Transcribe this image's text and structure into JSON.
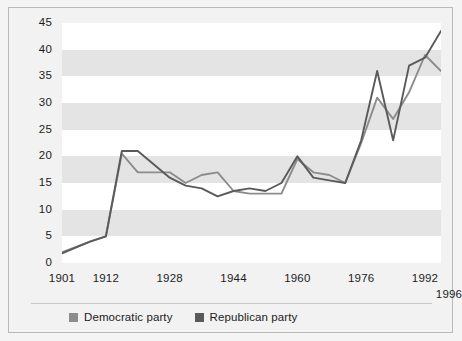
{
  "chart_data": {
    "type": "line",
    "title": "",
    "subtitle": "",
    "xlabel": "",
    "ylabel": "",
    "xlim": [
      1901,
      1996
    ],
    "ylim": [
      0,
      45
    ],
    "grid": "horizontal-bands",
    "legend_position": "bottom-left",
    "y_ticks": [
      0,
      5,
      10,
      15,
      20,
      25,
      30,
      35,
      40,
      45
    ],
    "x_ticks": [
      1901,
      1912,
      1928,
      1944,
      1960,
      1976,
      1992,
      1996
    ],
    "x_tick_labels": [
      "1901",
      "1912",
      "1928",
      "1944",
      "1960",
      "1976",
      "1992",
      "1996"
    ],
    "y_tick_labels": [
      "0",
      "5",
      "10",
      "15",
      "20",
      "25",
      "30",
      "35",
      "40",
      "45"
    ],
    "x": [
      1901,
      1908,
      1912,
      1916,
      1920,
      1928,
      1932,
      1936,
      1940,
      1944,
      1948,
      1952,
      1956,
      1960,
      1964,
      1968,
      1972,
      1976,
      1980,
      1984,
      1988,
      1992,
      1996
    ],
    "series": [
      {
        "name": "Democratic party",
        "color": "#8c8c8c",
        "values": [
          2,
          4,
          5,
          20.5,
          17,
          17,
          15,
          16.5,
          17,
          13.5,
          13,
          13,
          13,
          19.5,
          17,
          16.5,
          15,
          22.5,
          31,
          27,
          32,
          39,
          36
        ]
      },
      {
        "name": "Republican party",
        "color": "#5a5a5a",
        "values": [
          1.8,
          4,
          5,
          21,
          21,
          16,
          14.5,
          14,
          12.5,
          13.5,
          14,
          13.5,
          15,
          20,
          16,
          15.5,
          15,
          23,
          36,
          23,
          37,
          38.5,
          43.5
        ]
      }
    ]
  },
  "legend": {
    "entries": [
      {
        "label": "Democratic party",
        "color": "#8c8c8c"
      },
      {
        "label": "Republican party",
        "color": "#5a5a5a"
      }
    ]
  },
  "colors": {
    "background": "#f2f2f2",
    "band_light": "#ffffff",
    "band_shaded": "#e4e4e4",
    "border": "#b9b9b9",
    "text": "#1c1c1c",
    "democratic": "#8c8c8c",
    "republican": "#5a5a5a"
  }
}
